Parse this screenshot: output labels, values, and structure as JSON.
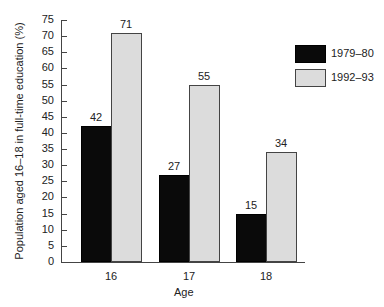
{
  "chart_data": {
    "type": "bar",
    "title": "",
    "xlabel": "Age",
    "ylabel": "Population aged 16–18 in full-time education (%)",
    "categories": [
      "16",
      "17",
      "18"
    ],
    "series": [
      {
        "name": "1979–80",
        "values": [
          42,
          27,
          15
        ],
        "color": "#0a0a0a"
      },
      {
        "name": "1992–93",
        "values": [
          71,
          55,
          34
        ],
        "color": "#dcdcdc"
      }
    ],
    "ylim": [
      0,
      75
    ],
    "yticks": [
      "0",
      "5",
      "10",
      "15",
      "20",
      "25",
      "30",
      "35",
      "40",
      "45",
      "50",
      "55",
      "60",
      "65",
      "70",
      "75"
    ],
    "grid": false,
    "legend_position": "upper right",
    "data_labels": true
  }
}
